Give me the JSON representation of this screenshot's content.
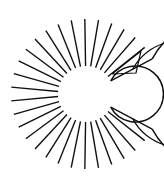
{
  "diagram": {
    "type": "radial-grid-c-shape",
    "stroke_color": "#111111",
    "background": "#ffffff",
    "center": [
      86,
      94
    ],
    "radii": {
      "inner": 28,
      "middle": 53,
      "outer": 75
    },
    "opening_half_angle_deg": 28,
    "spoke_step_deg": 10.4,
    "annotation": {
      "kind": "triangle",
      "points": [
        [
          112,
          74
        ],
        [
          136,
          73
        ],
        [
          141,
          51
        ]
      ]
    }
  }
}
